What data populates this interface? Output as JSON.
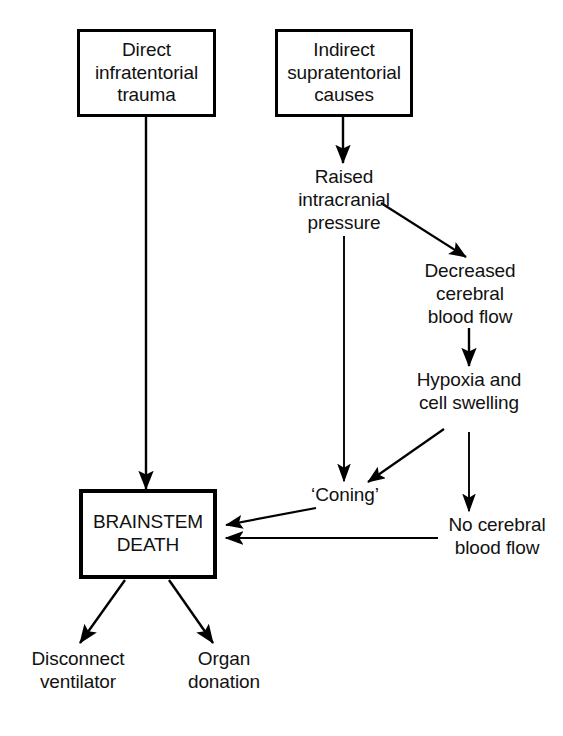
{
  "diagram": {
    "background_color": "#ffffff",
    "line_color": "#000000",
    "text_color": "#111111"
  },
  "nodes": {
    "direct_trauma": {
      "label": "Direct\ninfratentorial\ntrauma",
      "shape": "box"
    },
    "indirect_causes": {
      "label": "Indirect\nsupratentorial\ncauses",
      "shape": "box"
    },
    "raised_icp": {
      "label": "Raised\nintracranial\npressure",
      "shape": "text"
    },
    "decreased_cbf": {
      "label": "Decreased\ncerebral\nblood flow",
      "shape": "text"
    },
    "hypoxia": {
      "label": "Hypoxia and\ncell swelling",
      "shape": "text"
    },
    "coning": {
      "label": "‘Coning’",
      "shape": "text"
    },
    "no_cbf": {
      "label": "No cerebral\nblood flow",
      "shape": "text"
    },
    "brainstem_death": {
      "label": "BRAINSTEM\nDEATH",
      "shape": "box-emphasis"
    },
    "disconnect_ventilator": {
      "label": "Disconnect\nventilator",
      "shape": "text"
    },
    "organ_donation": {
      "label": "Organ\ndonation",
      "shape": "text"
    }
  },
  "edges": [
    {
      "id": "e1",
      "from": "direct_trauma",
      "to": "brainstem_death",
      "style": "vertical-arrow"
    },
    {
      "id": "e2",
      "from": "indirect_causes",
      "to": "raised_icp",
      "style": "vertical-arrow"
    },
    {
      "id": "e3",
      "from": "raised_icp",
      "to": "decreased_cbf",
      "style": "diagonal-arrow"
    },
    {
      "id": "e4",
      "from": "raised_icp",
      "to": "coning",
      "style": "vertical-arrow"
    },
    {
      "id": "e5",
      "from": "decreased_cbf",
      "to": "hypoxia",
      "style": "vertical-arrow"
    },
    {
      "id": "e6",
      "from": "hypoxia",
      "to": "coning",
      "style": "diagonal-arrow"
    },
    {
      "id": "e7",
      "from": "hypoxia",
      "to": "no_cbf",
      "style": "vertical-arrow"
    },
    {
      "id": "e8",
      "from": "coning",
      "to": "brainstem_death",
      "style": "diagonal-arrow"
    },
    {
      "id": "e9",
      "from": "no_cbf",
      "to": "brainstem_death",
      "style": "horizontal-arrow"
    },
    {
      "id": "e10",
      "from": "brainstem_death",
      "to": "disconnect_ventilator",
      "style": "diagonal-arrow"
    },
    {
      "id": "e11",
      "from": "brainstem_death",
      "to": "organ_donation",
      "style": "diagonal-arrow"
    }
  ]
}
